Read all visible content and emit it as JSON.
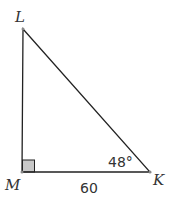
{
  "diagram": {
    "type": "right-triangle",
    "vertices": {
      "L": {
        "label": "L",
        "x": 23,
        "y": 29
      },
      "M": {
        "label": "M",
        "x": 22,
        "y": 172
      },
      "K": {
        "label": "K",
        "x": 150,
        "y": 172
      }
    },
    "right_angle_at": "M",
    "angle_label": "48°",
    "angle_at": "K",
    "side_label": "60",
    "side": "MK",
    "colors": {
      "line": "#222222",
      "right_angle_fill": "#c8c8c8",
      "text": "#333333"
    }
  }
}
